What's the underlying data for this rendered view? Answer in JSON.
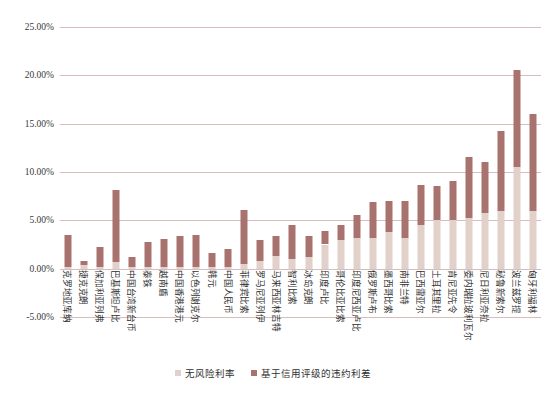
{
  "chart_data": {
    "type": "bar",
    "stacked": true,
    "title": "",
    "xlabel": "",
    "ylabel": "",
    "ylim": [
      -5,
      25
    ],
    "ytick_values": [
      25,
      20,
      15,
      10,
      5,
      0,
      -5
    ],
    "ytick_labels": [
      "25.00%",
      "20.00%",
      "15.00%",
      "10.00%",
      "5.00%",
      "0.00%",
      "-5.00%"
    ],
    "grid": true,
    "legend_position": "bottom-center",
    "categories": [
      "克罗地亚库纳",
      "捷克克朗",
      "保加利亚列弗",
      "巴基斯坦卢比",
      "中国台湾新台币",
      "泰铢",
      "越南盾",
      "中国香港港元",
      "以色列谢克尔",
      "韩元",
      "中国人民币",
      "菲律宾比索",
      "罗马尼亚列伊",
      "马来西亚林吉特",
      "智利比索",
      "冰岛克朗",
      "印度卢比",
      "哥伦比亚比索",
      "印度尼西亚卢比",
      "俄罗斯卢布",
      "墨西哥比索",
      "南非兰特",
      "巴西雷亚尔",
      "土耳其里拉",
      "肯尼亚先令",
      "委内瑞拉玻利瓦尔",
      "尼日利亚奈拉",
      "秘鲁新索尔",
      "波兰兹罗提",
      "匈牙利福林"
    ],
    "series": [
      {
        "name": "无风险利率",
        "color": "#e2d0cb",
        "values": [
          0.2,
          0.4,
          0.2,
          0.7,
          0.2,
          0.2,
          0.2,
          0.2,
          0.2,
          0.2,
          0.2,
          0.5,
          0.8,
          1.3,
          1.0,
          1.2,
          2.5,
          3.0,
          3.2,
          3.2,
          3.8,
          3.2,
          4.5,
          5.0,
          5.0,
          5.2,
          5.8,
          6.0,
          10.5,
          6.0
        ]
      },
      {
        "name": "基于信用评级的违约利差",
        "color": "#a8736e",
        "values": [
          3.3,
          0.4,
          2.0,
          7.4,
          1.0,
          2.6,
          2.9,
          3.2,
          3.3,
          1.4,
          1.8,
          5.6,
          2.2,
          2.1,
          3.5,
          2.2,
          1.4,
          1.5,
          2.4,
          3.7,
          3.2,
          3.8,
          4.2,
          3.6,
          4.1,
          6.4,
          5.2,
          8.2,
          10.1,
          10.0
        ]
      }
    ],
    "totals": [
      3.5,
      0.8,
      2.2,
      8.1,
      1.2,
      2.8,
      3.1,
      3.4,
      3.5,
      1.6,
      2.0,
      6.1,
      3.0,
      3.4,
      4.5,
      3.4,
      3.9,
      4.5,
      5.6,
      6.9,
      7.0,
      7.0,
      8.7,
      8.6,
      9.1,
      11.6,
      11.0,
      14.2,
      20.6,
      16.0
    ]
  },
  "legend": {
    "items": [
      {
        "label": "无风险利率"
      },
      {
        "label": "基于信用评级的违约利差"
      }
    ]
  }
}
